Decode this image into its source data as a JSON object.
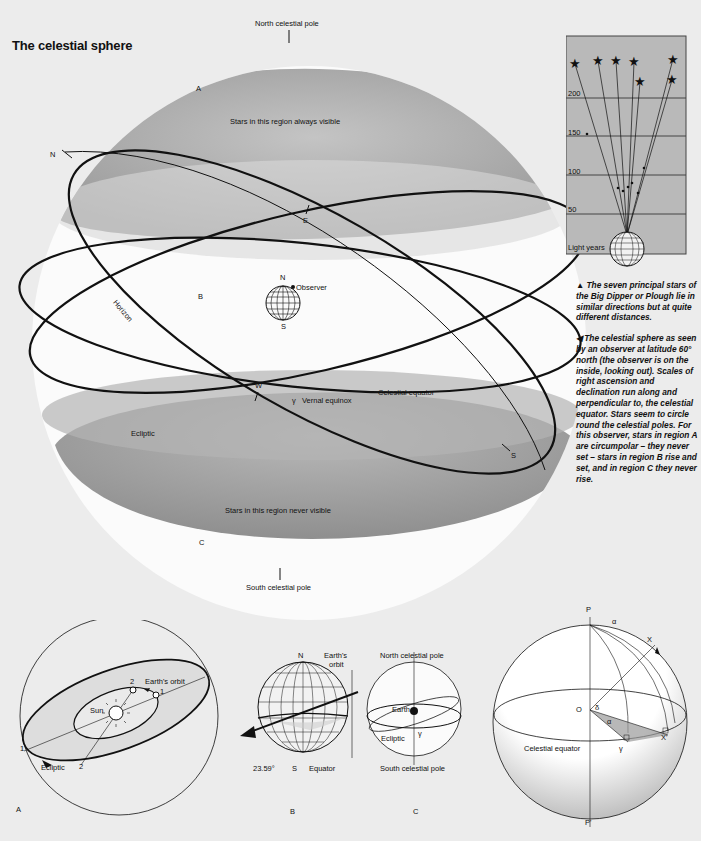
{
  "title": "The celestial sphere",
  "main_diagram": {
    "north_pole_label": "North celestial pole",
    "south_pole_label": "South celestial pole",
    "region_a": "A",
    "region_b": "B",
    "region_c": "C",
    "always_visible": "Stars in this region always visible",
    "never_visible": "Stars in this region never visible",
    "observer_label": "Observer",
    "observer_n": "N",
    "observer_s": "S",
    "point_n": "N",
    "point_e": "E",
    "point_w": "W",
    "point_s": "S",
    "horizon_label": "Horizon",
    "ecliptic_label": "Ecliptic",
    "celestial_equator_label": "Celestial equator",
    "vernal_equinox_label": "Vernal equinox",
    "vernal_symbol": "γ"
  },
  "big_dipper_chart": {
    "scale_labels": [
      "200",
      "150",
      "100",
      "50"
    ],
    "unit_label": "Light years",
    "star_count": 7
  },
  "captions": {
    "big_dipper": "▲ The seven principal stars of the Big Dipper or Plough lie in similar directions but at quite different distances.",
    "sphere": "◀ The celestial sphere as seen by an observer at latitude 60° north (the observer is on the inside, looking out). Scales of right ascension and declination run along and perpendicular to, the celestial equator. Stars seem to circle round the celestial poles. For this observer, stars in region A are circumpolar – they never set – stars in region B rise and set, and in region C they never rise."
  },
  "fig_a": {
    "panel_label": "A",
    "sun_label": "Sun",
    "earth_orbit_label": "Earth's orbit",
    "ecliptic_label": "Ecliptic",
    "pos1": "1",
    "pos2": "2",
    "proj2": "2",
    "proj1": "1"
  },
  "fig_b": {
    "panel_label": "B",
    "n_label": "N",
    "s_label": "S",
    "orbit_label_1": "Earth's",
    "orbit_label_2": "orbit",
    "tilt_label": "23.59°",
    "equator_label": "Equator"
  },
  "fig_c": {
    "panel_label": "C",
    "north_pole_label": "North celestial pole",
    "south_pole_label": "South celestial pole",
    "earth_label": "Earth",
    "ecliptic_label": "Ecliptic",
    "vernal_symbol": "γ"
  },
  "fig_d": {
    "p_label": "P",
    "p_prime_label": "P'",
    "o_label": "O",
    "x_label": "X",
    "x_prime_label": "X'",
    "alpha_label": "α",
    "delta_label": "δ",
    "vernal_symbol": "γ",
    "celestial_equator_label": "Celestial equator"
  },
  "colors": {
    "background": "#ececec",
    "sphere_white": "#fdfdfd",
    "cap_gray": "#a9a9a9",
    "chart_bg": "#b9b9b9",
    "line": "#111111"
  }
}
